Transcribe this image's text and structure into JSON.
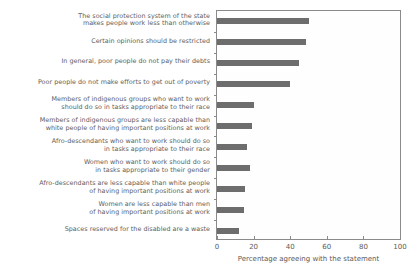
{
  "chart_data": {
    "type": "bar",
    "orientation": "horizontal",
    "title": "",
    "xlabel": "Percentage agreeing with the statement",
    "ylabel": "",
    "xlim": [
      0,
      100
    ],
    "xticks": [
      0,
      20,
      40,
      60,
      80,
      100
    ],
    "xtick_labels": [
      "0",
      "20",
      "40",
      "60",
      "80",
      "100"
    ],
    "grid": false,
    "legend": "none",
    "bar_color": "#6d6d6d",
    "axis_color": "#8a8a8a",
    "categories": [
      "The social protection system of the state\nmakes people work less than otherwise",
      "Certain opinions should be restricted",
      "In general, poor people do not pay their debts",
      "Poor people do not make efforts to get out of poverty",
      "Members of indigenous groups who want to work\nshould do so in tasks appropriate to their race",
      "Members of indigenous groups are less capable than\nwhite people of having important positions at work",
      "Afro-descendants who want to work should do so\nin tasks appropriate to their race",
      "Women who want to work should do so\nin tasks appropriate to their gender",
      "Afro-descendants are less capable than white people\nof having important positions at work",
      "Women are less capable than men\nof having important positions at work",
      "Spaces reserved for the disabled are a waste"
    ],
    "values": [
      50,
      48.5,
      45,
      40,
      20,
      19,
      16.5,
      18,
      15.5,
      14.5,
      12
    ]
  }
}
